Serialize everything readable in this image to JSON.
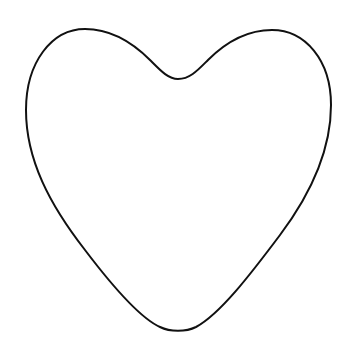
{
  "image": {
    "subject": "heart outline",
    "background_color": "#ffffff",
    "stroke_color": "#111111",
    "fill_color": "#ffffff",
    "stroke_width": 2
  }
}
